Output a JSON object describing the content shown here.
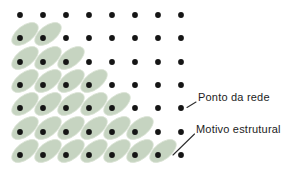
{
  "diagram": {
    "title_semantic": "2D lattice with structural motif",
    "background": "#ffffff",
    "dot_color": "#151515",
    "motif_color": "#c6d4c1",
    "motif_edge_color": "#d9e2d4",
    "leader_color": "#2e2e2e",
    "lattice": {
      "cols_x": [
        20,
        43,
        66,
        89,
        112,
        135,
        158,
        181
      ],
      "rows_y": [
        15,
        38,
        62,
        85,
        108,
        132,
        155
      ],
      "dot_radius": 2.9
    },
    "motif": {
      "rx": 15.5,
      "ry": 8.2,
      "rotation_deg": -38,
      "offset_x": 5,
      "offset_y": -4,
      "counts_per_row": [
        0,
        2,
        3,
        4,
        5,
        6,
        7
      ]
    },
    "labels": {
      "lattice_point": {
        "text": "Ponto da rede",
        "x": 198,
        "y": 91
      },
      "motif": {
        "text": "Motivo estrutural",
        "x": 196,
        "y": 123
      }
    },
    "leaders": {
      "lattice_point": {
        "x1": 196,
        "y1": 102,
        "x2": 187,
        "y2": 107.5
      },
      "motif": {
        "x1": 194.5,
        "y1": 134,
        "x2": 173,
        "y2": 155
      }
    }
  }
}
